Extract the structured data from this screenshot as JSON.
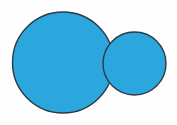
{
  "figure": {
    "canvas": {
      "width": 177,
      "height": 125,
      "background_color": "#fefefe"
    },
    "style": {
      "fill_color": "#2ca7de",
      "stroke_color": "#2b3a47",
      "stroke_width": 1.4,
      "fill_opacity": 1
    },
    "shapes": [
      {
        "name": "large-circle",
        "type": "circle",
        "cx": 63,
        "cy": 62.5,
        "r": 50.5,
        "fill": "#2ca7de",
        "stroke": "#2b3a47",
        "stroke_width": 1.4,
        "z": 1
      },
      {
        "name": "small-circle",
        "type": "circle",
        "cx": 134.5,
        "cy": 63.5,
        "r": 31.5,
        "fill": "#2ca7de",
        "stroke": "#2b3a47",
        "stroke_width": 1.4,
        "z": 2
      }
    ]
  },
  "chart_data": {
    "type": "scatter",
    "xlabel": "",
    "ylabel": "",
    "xlim": [
      0,
      177
    ],
    "ylim": [
      0,
      125
    ],
    "grid": false,
    "legend": "none",
    "series": [
      {
        "name": "large-circle",
        "marker": "circle",
        "x": [
          63
        ],
        "y": [
          62.5
        ],
        "radius": [
          50.5
        ],
        "color": "#2ca7de",
        "edgecolor": "#2b3a47"
      },
      {
        "name": "small-circle",
        "marker": "circle",
        "x": [
          134.5
        ],
        "y": [
          63.5
        ],
        "radius": [
          31.5
        ],
        "color": "#2ca7de",
        "edgecolor": "#2b3a47"
      }
    ],
    "annotations": []
  }
}
